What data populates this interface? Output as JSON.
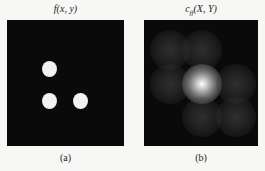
{
  "figure": {
    "panels": [
      {
        "id": "a",
        "title_main": "f(x, y)",
        "caption": "(a)",
        "description": "Binary input image: three white disks on black background",
        "dots": [
          {
            "cx": 42,
            "cy": 49
          },
          {
            "cx": 42,
            "cy": 81
          },
          {
            "cx": 73,
            "cy": 81
          }
        ]
      },
      {
        "id": "b",
        "title_base": "c",
        "title_sub": "ff",
        "title_args": "(X, Y)",
        "caption": "(b)",
        "description": "Autocorrelation: bright central peak with six dimmer surrounding peaks",
        "peaks": [
          {
            "cx": 26,
            "cy": 30,
            "intensity": 0.28
          },
          {
            "cx": 58,
            "cy": 30,
            "intensity": 0.28
          },
          {
            "cx": 26,
            "cy": 64,
            "intensity": 0.28
          },
          {
            "cx": 58,
            "cy": 64,
            "intensity": 1.0
          },
          {
            "cx": 92,
            "cy": 64,
            "intensity": 0.28
          },
          {
            "cx": 58,
            "cy": 97,
            "intensity": 0.28
          },
          {
            "cx": 92,
            "cy": 97,
            "intensity": 0.28
          }
        ]
      }
    ]
  }
}
